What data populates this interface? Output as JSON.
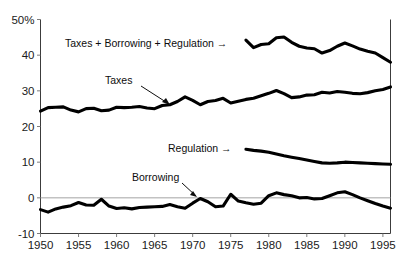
{
  "chart_data": {
    "type": "line",
    "title": "",
    "xlabel": "",
    "ylabel": "",
    "xlim": [
      1950,
      1996
    ],
    "ylim": [
      -10,
      50
    ],
    "y_unit": "%",
    "grid": false,
    "legend_position": "inline-annotations",
    "ytick_labels": [
      "50%",
      "40",
      "30",
      "20",
      "10",
      "0",
      "-10"
    ],
    "ytick_values": [
      50,
      40,
      30,
      20,
      10,
      0,
      -10
    ],
    "xtick_labels": [
      "1950",
      "1955",
      "1960",
      "1965",
      "1970",
      "1975",
      "1980",
      "1985",
      "1990",
      "1995"
    ],
    "xtick_values": [
      1950,
      1955,
      1960,
      1965,
      1970,
      1975,
      1980,
      1985,
      1990,
      1995
    ],
    "zero_reference_line": 0,
    "annotations": [
      {
        "text": "Taxes + Borrowing + Regulation →",
        "series": "Taxes + Borrowing + Regulation"
      },
      {
        "text": "Taxes",
        "series": "Taxes"
      },
      {
        "text": "Regulation →",
        "series": "Regulation"
      },
      {
        "text": "Borrowing",
        "series": "Borrowing"
      }
    ],
    "series": [
      {
        "name": "Taxes + Borrowing + Regulation",
        "x": [
          1977,
          1978,
          1979,
          1980,
          1981,
          1982,
          1983,
          1984,
          1985,
          1986,
          1987,
          1988,
          1989,
          1990,
          1991,
          1992,
          1993,
          1994,
          1995,
          1996
        ],
        "values": [
          44.2,
          42.1,
          43.0,
          43.2,
          44.9,
          45.1,
          43.6,
          42.5,
          42.0,
          41.8,
          40.6,
          41.3,
          42.5,
          43.4,
          42.6,
          41.7,
          41.1,
          40.6,
          39.3,
          38.0
        ]
      },
      {
        "name": "Taxes",
        "x": [
          1950,
          1951,
          1952,
          1953,
          1954,
          1955,
          1956,
          1957,
          1958,
          1959,
          1960,
          1961,
          1962,
          1963,
          1964,
          1965,
          1966,
          1967,
          1968,
          1969,
          1970,
          1971,
          1972,
          1973,
          1974,
          1975,
          1976,
          1977,
          1978,
          1979,
          1980,
          1981,
          1982,
          1983,
          1984,
          1985,
          1986,
          1987,
          1988,
          1989,
          1990,
          1991,
          1992,
          1993,
          1994,
          1995,
          1996
        ],
        "values": [
          24.3,
          25.3,
          25.4,
          25.5,
          24.6,
          24.1,
          25.0,
          25.1,
          24.4,
          24.6,
          25.4,
          25.3,
          25.4,
          25.6,
          25.2,
          25.0,
          25.9,
          26.1,
          27.0,
          28.3,
          27.3,
          26.1,
          27.0,
          27.3,
          27.9,
          26.6,
          27.1,
          27.6,
          27.9,
          28.6,
          29.3,
          30.1,
          29.2,
          28.1,
          28.3,
          28.8,
          28.9,
          29.6,
          29.4,
          29.8,
          29.6,
          29.3,
          29.2,
          29.5,
          30.0,
          30.4,
          31.1
        ]
      },
      {
        "name": "Regulation",
        "x": [
          1977,
          1978,
          1979,
          1980,
          1981,
          1982,
          1983,
          1984,
          1985,
          1986,
          1987,
          1988,
          1989,
          1990,
          1991,
          1992,
          1993,
          1994,
          1995,
          1996
        ],
        "values": [
          13.6,
          13.3,
          13.1,
          12.8,
          12.3,
          11.8,
          11.4,
          11.0,
          10.6,
          10.2,
          9.8,
          9.7,
          9.8,
          10.0,
          9.9,
          9.8,
          9.7,
          9.6,
          9.5,
          9.4
        ]
      },
      {
        "name": "Borrowing",
        "x": [
          1950,
          1951,
          1952,
          1953,
          1954,
          1955,
          1956,
          1957,
          1958,
          1959,
          1960,
          1961,
          1962,
          1963,
          1964,
          1965,
          1966,
          1967,
          1968,
          1969,
          1970,
          1971,
          1972,
          1973,
          1974,
          1975,
          1976,
          1977,
          1978,
          1979,
          1980,
          1981,
          1982,
          1983,
          1984,
          1985,
          1986,
          1987,
          1988,
          1989,
          1990,
          1991,
          1992,
          1993,
          1994,
          1995,
          1996
        ],
        "values": [
          -3.3,
          -4.0,
          -3.1,
          -2.6,
          -2.2,
          -1.3,
          -2.0,
          -2.1,
          -0.4,
          -2.3,
          -3.0,
          -2.8,
          -3.1,
          -2.7,
          -2.6,
          -2.5,
          -2.4,
          -1.9,
          -2.5,
          -2.9,
          -1.5,
          -0.2,
          -1.1,
          -2.5,
          -2.3,
          1.0,
          -0.9,
          -1.4,
          -1.8,
          -1.5,
          0.6,
          1.4,
          0.9,
          0.6,
          0.0,
          0.1,
          -0.3,
          -0.2,
          0.6,
          1.4,
          1.7,
          0.9,
          0.0,
          -0.8,
          -1.6,
          -2.3,
          -2.9
        ]
      }
    ]
  }
}
